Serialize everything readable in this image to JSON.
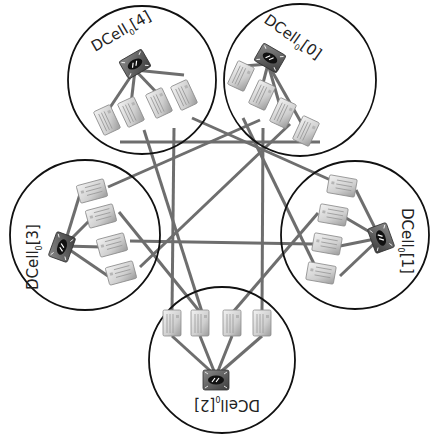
{
  "diagram": {
    "type": "network-topology",
    "colors": {
      "circle_stroke": "#111111",
      "link": "#6e6e6e",
      "server_body": "#d8d8d8",
      "switch_body": "#555555"
    },
    "cells": [
      {
        "id": "0",
        "label_main": "DCell",
        "label_sub": "0",
        "label_index": "[0]",
        "center": [
          300,
          80
        ],
        "radius": 76,
        "switch": [
          268,
          62
        ],
        "label_pos": [
          268,
          22
        ],
        "label_rotation": 42,
        "servers": [
          [
            241,
            76
          ],
          [
            262,
            95
          ],
          [
            283,
            113
          ],
          [
            306,
            131
          ]
        ]
      },
      {
        "id": "1",
        "label_main": "DCell",
        "label_sub": "0",
        "label_index": "[1]",
        "center": [
          355,
          235
        ],
        "radius": 74,
        "switch": [
          381,
          238
        ],
        "label_pos": [
          409,
          210
        ],
        "label_rotation": 90,
        "servers": [
          [
            336,
            186
          ],
          [
            328,
            215
          ],
          [
            322,
            244
          ],
          [
            316,
            273
          ]
        ]
      },
      {
        "id": "2",
        "label_main": "DCell",
        "label_sub": "0",
        "label_index": "[2]",
        "center": [
          222,
          360
        ],
        "radius": 73,
        "switch": [
          216,
          378
        ],
        "label_pos": [
          222,
          408
        ],
        "label_rotation": 180,
        "servers": [
          [
            172,
            323
          ],
          [
            200,
            323
          ],
          [
            232,
            323
          ],
          [
            262,
            323
          ]
        ]
      },
      {
        "id": "3",
        "label_main": "DCell",
        "label_sub": "0",
        "label_index": "[3]",
        "center": [
          85,
          235
        ],
        "radius": 75,
        "switch": [
          62,
          247
        ],
        "label_pos": [
          30,
          260
        ],
        "label_rotation": -90,
        "servers": [
          [
            92,
            191
          ],
          [
            101,
            216
          ],
          [
            112,
            245
          ],
          [
            121,
            273
          ]
        ]
      },
      {
        "id": "4",
        "label_main": "DCell",
        "label_sub": "0",
        "label_index": "[4]",
        "center": [
          142,
          80
        ],
        "radius": 74,
        "switch": [
          135,
          68
        ],
        "label_pos": [
          120,
          45
        ],
        "label_rotation": -30,
        "servers": [
          [
            107,
            120
          ],
          [
            131,
            112
          ],
          [
            159,
            103
          ],
          [
            184,
            95
          ]
        ]
      }
    ],
    "inter_cell_links": [
      {
        "from": "4.0",
        "to": "0.0",
        "points": [
          [
            118,
            142
          ],
          [
            318,
            142
          ]
        ]
      },
      {
        "from": "4.1",
        "to": "2.1",
        "points": [
          [
            142,
            132
          ],
          [
            200,
            310
          ]
        ]
      },
      {
        "from": "4.2",
        "to": "1.0",
        "points": [
          [
            175,
            117
          ],
          [
            175,
            120
          ]
        ]
      },
      {
        "from": "4.3",
        "to": "2.0",
        "points": [
          [
            174,
            138
          ],
          [
            174,
            310
          ]
        ]
      },
      {
        "from": "0.1",
        "to": "3.0",
        "points": [
          [
            260,
            120
          ],
          [
            107,
            185
          ]
        ]
      },
      {
        "from": "0.2",
        "to": "2.3",
        "points": [
          [
            265,
            125
          ],
          [
            265,
            310
          ]
        ]
      },
      {
        "from": "0.3",
        "to": "1.0",
        "points": [
          [
            296,
            120
          ],
          [
            336,
            182
          ]
        ]
      },
      {
        "from": "0.0",
        "to": "2.2",
        "points": [
          [
            242,
            115
          ],
          [
            242,
            310
          ]
        ]
      },
      {
        "from": "3.1",
        "to": "2.1",
        "points": [
          [
            118,
            210
          ],
          [
            200,
            310
          ]
        ]
      },
      {
        "from": "3.2",
        "to": "1.2",
        "points": [
          [
            130,
            240
          ],
          [
            312,
            244
          ]
        ]
      },
      {
        "from": "3.3",
        "to": "0.1",
        "points": [
          [
            140,
            268
          ],
          [
            290,
            128
          ]
        ]
      },
      {
        "from": "1.1",
        "to": "2.2",
        "points": [
          [
            318,
            213
          ],
          [
            232,
            310
          ]
        ]
      },
      {
        "from": "1.3",
        "to": "3.1",
        "points": [
          [
            308,
            272
          ],
          [
            118,
            211
          ]
        ]
      }
    ]
  }
}
